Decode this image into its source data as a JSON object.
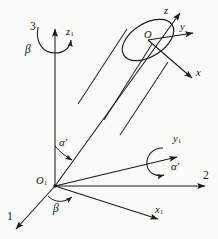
{
  "figure": {
    "kind": "3d-coordinate-diagram",
    "stroke_color": "#1a1a1a",
    "background_color": "#fbfbfa"
  },
  "labels": {
    "axis_3": "3",
    "axis_1": "1",
    "axis_2": "2",
    "beta_top": "β",
    "beta_bottom": "β",
    "alpha_left": "α′",
    "alpha_right": "α′",
    "origin_O1_name": "O",
    "origin_O1_sub": "1",
    "origin_O_name": "O",
    "axis_z1_name": "z",
    "axis_z1_sub": "1",
    "axis_y1_name": "y",
    "axis_y1_sub": "1",
    "axis_x1_name": "x",
    "axis_x1_sub": "1",
    "axis_z_name": "z",
    "axis_y_name": "y",
    "axis_x_name": "x"
  }
}
